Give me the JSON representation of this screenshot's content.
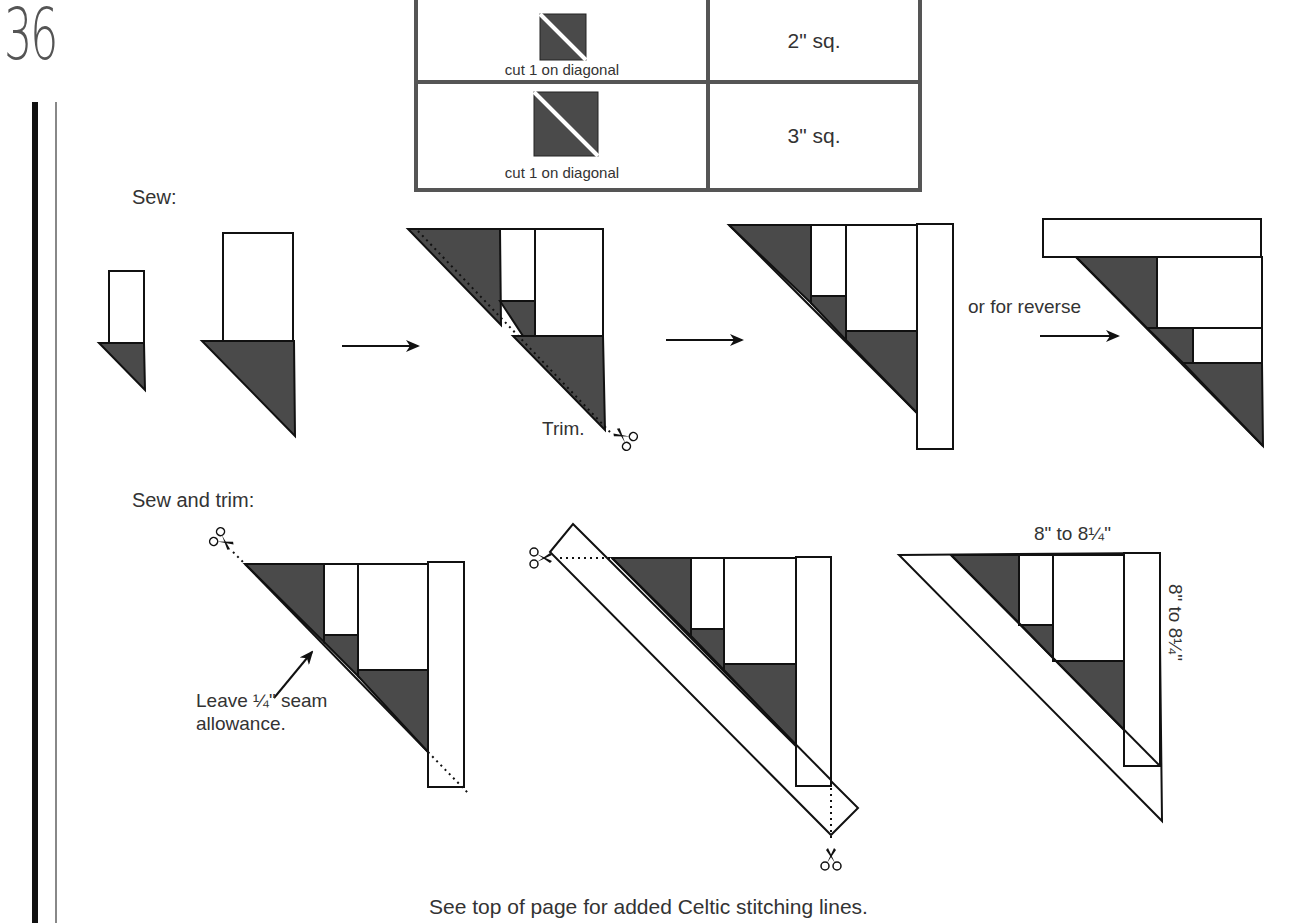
{
  "page": {
    "number": "36"
  },
  "cut_table": {
    "rows": [
      {
        "icon": "half-square-triangle-small-icon",
        "caption": "cut 1 on diagonal",
        "size": "2\" sq."
      },
      {
        "icon": "half-square-triangle-large-icon",
        "caption": "cut 1 on diagonal",
        "size": "3\" sq."
      }
    ]
  },
  "sections": {
    "sew": {
      "heading": "Sew:",
      "trim_label": "Trim.",
      "reverse_label": "or for reverse"
    },
    "sew_and_trim": {
      "heading": "Sew and trim:",
      "seam_note_line1": "Leave ¼\" seam",
      "seam_note_line2": "allowance.",
      "dimension_top": "8\" to 8¼\"",
      "dimension_side": "8\" to 8¼\""
    }
  },
  "footer": {
    "note": "See top of page for added Celtic stitching lines."
  },
  "colors": {
    "fabric_dark": "#4a4a4a",
    "outline": "#111111",
    "table_border": "#555555",
    "text": "#333333"
  }
}
